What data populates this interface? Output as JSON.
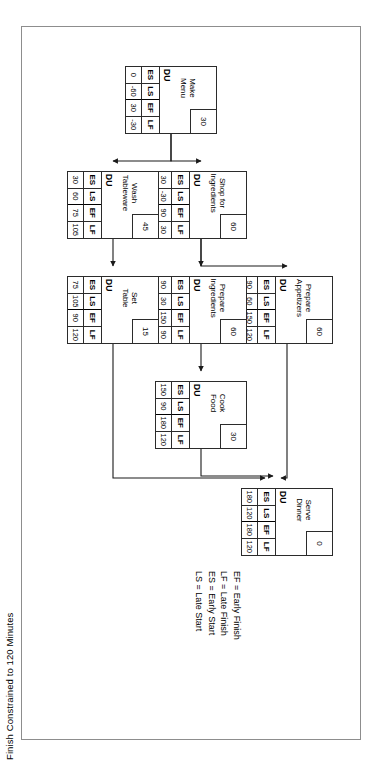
{
  "title": "Finish Constrained to 120 Minutes",
  "legend": {
    "lines": [
      "EF = Early Finish",
      "LF = Late Finish",
      "ES = Early Start",
      "LS = Late Start"
    ]
  },
  "node_headers": {
    "es": "ES",
    "ls": "LS",
    "ef": "EF",
    "lf": "LF",
    "du": "DU"
  },
  "nodes": [
    {
      "id": "make-menu",
      "name": "Make\nMenu",
      "du": "30",
      "es": "0",
      "ls": "-60",
      "ef": "30",
      "lf": "-30"
    },
    {
      "id": "shop-for-ingredients",
      "name": "Shop for\nIngredients",
      "du": "60",
      "es": "30",
      "ls": "-30",
      "ef": "90",
      "lf": "30"
    },
    {
      "id": "wash-tableware",
      "name": "Wash\nTableware",
      "du": "45",
      "es": "30",
      "ls": "60",
      "ef": "75",
      "lf": "105"
    },
    {
      "id": "prepare-appetizers",
      "name": "Prepare\nAppetizers",
      "du": "60",
      "es": "90",
      "ls": "60",
      "ef": "150",
      "lf": "120"
    },
    {
      "id": "prepare-ingredients",
      "name": "Prepare\nIngredients",
      "du": "60",
      "es": "90",
      "ls": "30",
      "ef": "150",
      "lf": "90"
    },
    {
      "id": "set-table",
      "name": "Set\nTable",
      "du": "15",
      "es": "75",
      "ls": "105",
      "ef": "90",
      "lf": "120"
    },
    {
      "id": "cook-food",
      "name": "Cook\nFood",
      "du": "30",
      "es": "150",
      "ls": "90",
      "ef": "180",
      "lf": "120"
    },
    {
      "id": "serve-dinner",
      "name": "Serve\nDinner",
      "du": "0",
      "es": "180",
      "ls": "120",
      "ef": "180",
      "lf": "120"
    }
  ],
  "colors": {
    "frame_border": "#8d8d8d",
    "node_border": "#2b2b2b",
    "connector": "#1a1a1a",
    "background": "#ffffff"
  }
}
